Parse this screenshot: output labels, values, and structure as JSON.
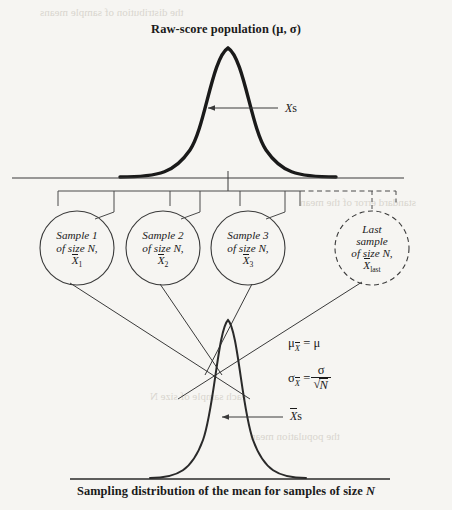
{
  "figure": {
    "type": "diagram",
    "topic": "sampling-distribution-of-the-mean",
    "title_top": "Raw-score population (μ, σ)",
    "caption_bottom_before": "Sampling distribution of the mean for samples of size ",
    "caption_bottom_italic": "N",
    "background_color": "#f6f5f2",
    "ink_color": "#1a1a1a"
  },
  "population": {
    "label_italic": "X",
    "label_plain": "s",
    "curve_note": "thick bell curve",
    "baseline_tick": "center tick mark at mean"
  },
  "sampling": {
    "label_italic": "X",
    "label_plain": "s",
    "curve_note": "narrow bell curve"
  },
  "samples": [
    {
      "line1": "Sample 1",
      "line2": "of size N,",
      "sym": "X",
      "sub": "1",
      "dashed": false
    },
    {
      "line1": "Sample 2",
      "line2": "of size N,",
      "sym": "X",
      "sub": "2",
      "dashed": false
    },
    {
      "line1": "Sample 3",
      "line2": "of size N,",
      "sym": "X",
      "sub": "3",
      "dashed": false
    },
    {
      "line1": "Last",
      "line2": "sample",
      "line3": "of size N,",
      "sym": "X",
      "sub": "last",
      "dashed": true
    }
  ],
  "formulas": {
    "mean": {
      "lhs_sym": "μ",
      "lhs_sub": "X",
      "eq": "=",
      "rhs": "μ"
    },
    "sd": {
      "lhs_sym": "σ",
      "lhs_sub": "X",
      "eq": "=",
      "numerator": "σ",
      "denominator": "N"
    }
  },
  "bleed_through": [
    "the distribution of sample means",
    "standard error of the mean",
    "each sample of size N",
    "the population mean"
  ]
}
